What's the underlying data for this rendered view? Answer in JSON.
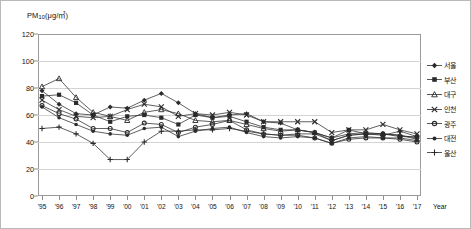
{
  "chart_data": {
    "type": "line",
    "title": "",
    "ylabel": "PM10(μg/㎥)",
    "ylabel_base": "PM",
    "ylabel_sub": "10",
    "ylabel_unit": "(μg/㎥)",
    "xlabel": "Year",
    "ylim": [
      0,
      120
    ],
    "ytick_step": 20,
    "grid": true,
    "legend_position": "right",
    "yticks": [
      "0",
      "20",
      "40",
      "60",
      "80",
      "100",
      "120"
    ],
    "categories": [
      "'95",
      "'96",
      "'97",
      "'98",
      "'99",
      "'00",
      "'01",
      "'02",
      "'03",
      "'04",
      "'05",
      "'06",
      "'07",
      "'08",
      "'09",
      "'10",
      "'11",
      "'12",
      "'13",
      "'14",
      "'15",
      "'16",
      "'17"
    ],
    "series": [
      {
        "name": "서울",
        "marker": "diamond",
        "values": [
          78,
          68,
          61,
          60,
          66,
          65,
          71,
          76,
          69,
          61,
          58,
          60,
          61,
          55,
          54,
          49,
          47,
          41,
          45,
          46,
          45,
          48,
          44
        ]
      },
      {
        "name": "부산",
        "marker": "square",
        "values": [
          74,
          75,
          69,
          60,
          55,
          59,
          60,
          58,
          53,
          60,
          58,
          59,
          55,
          51,
          49,
          49,
          47,
          43,
          49,
          46,
          46,
          44,
          44
        ]
      },
      {
        "name": "대구",
        "marker": "triangle",
        "values": [
          81,
          87,
          73,
          62,
          59,
          56,
          62,
          64,
          61,
          56,
          55,
          56,
          53,
          50,
          48,
          49,
          47,
          43,
          46,
          47,
          46,
          45,
          42
        ]
      },
      {
        "name": "인천",
        "marker": "cross",
        "values": [
          71,
          64,
          59,
          58,
          59,
          64,
          68,
          66,
          59,
          61,
          60,
          62,
          60,
          55,
          55,
          55,
          55,
          47,
          49,
          49,
          53,
          49,
          46
        ]
      },
      {
        "name": "광주",
        "marker": "circle",
        "values": [
          67,
          61,
          57,
          50,
          50,
          47,
          54,
          53,
          47,
          51,
          53,
          56,
          49,
          46,
          45,
          45,
          43,
          39,
          42,
          43,
          43,
          42,
          40
        ]
      },
      {
        "name": "대전",
        "marker": "dot",
        "values": [
          66,
          58,
          53,
          48,
          46,
          45,
          50,
          51,
          44,
          48,
          50,
          51,
          47,
          44,
          43,
          44,
          43,
          39,
          43,
          44,
          43,
          43,
          41
        ]
      },
      {
        "name": "울산",
        "marker": "plus",
        "values": [
          50,
          51,
          46,
          39,
          27,
          27,
          40,
          48,
          48,
          49,
          49,
          50,
          48,
          46,
          45,
          46,
          46,
          41,
          45,
          46,
          46,
          45,
          43
        ]
      }
    ]
  },
  "legend": {
    "items": [
      "서울",
      "부산",
      "대구",
      "인천",
      "광주",
      "대전",
      "울산"
    ]
  },
  "colors": {
    "line": "#2b2b2b",
    "grid": "#d3d3d3",
    "frame": "#9a9a9a",
    "border": "#b9b9b9",
    "text": "#111111"
  }
}
